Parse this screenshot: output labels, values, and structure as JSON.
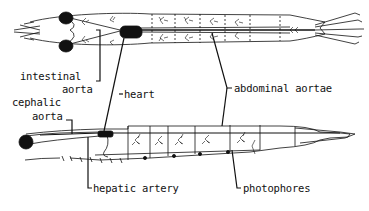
{
  "diagram": {
    "views": [
      "dorsal view",
      "lateral view"
    ],
    "colors": {
      "ink": "#111111",
      "background": "#ffffff"
    },
    "labels": {
      "intestinal_aorta_line1": "intestinal",
      "intestinal_aorta_line2": "aorta",
      "heart": "heart",
      "abdominal_aortae": "abdominal aortae",
      "cephalic_aorta_line1": "cephalic",
      "cephalic_aorta_line2": "aorta",
      "hepatic_artery": "hepatic artery",
      "photophores": "photophores"
    }
  }
}
